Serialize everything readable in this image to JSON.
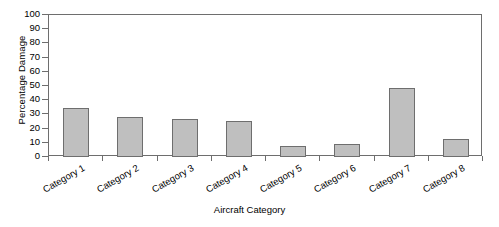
{
  "chart_data": {
    "type": "bar",
    "title": "",
    "xlabel": "Aircraft Category",
    "ylabel": "Percentage Damage",
    "categories": [
      "Category 1",
      "Category 2",
      "Category 3",
      "Category 4",
      "Category 5",
      "Category 6",
      "Category 7",
      "Category 8"
    ],
    "values": [
      34.5,
      28.5,
      27,
      25.5,
      8,
      9,
      48.5,
      13
    ],
    "ylim": [
      0,
      100
    ],
    "ytick_labels": [
      "0",
      "10",
      "20",
      "30",
      "40",
      "50",
      "60",
      "70",
      "80",
      "90",
      "100"
    ],
    "ytick_values": [
      0,
      10,
      20,
      30,
      40,
      50,
      60,
      70,
      80,
      90,
      100
    ],
    "grid": false,
    "legend": false,
    "legend_position": "none",
    "bar_fill_color": "#bfbfbf",
    "bar_border_color": "#6e6e6e",
    "axis_color": "#6e6e6e",
    "background_color": "#ffffff",
    "xtick_label_rotation": -30
  }
}
